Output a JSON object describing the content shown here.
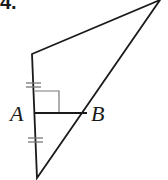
{
  "problem": {
    "number": "4."
  },
  "diagram": {
    "type": "triangle-with-perpendicular-segment",
    "stroke_color": "#1a1a1a",
    "aux_color": "#777777",
    "vertices": {
      "top_right": [
        160,
        0
      ],
      "top_left": [
        32,
        54
      ],
      "bottom": [
        37,
        178
      ]
    },
    "points": [
      {
        "label": "A",
        "at": [
          35,
          113
        ],
        "label_pos": [
          10,
          121
        ]
      },
      {
        "label": "B",
        "at": [
          87,
          112
        ],
        "label_pos": [
          91,
          121
        ]
      }
    ],
    "right_angle_marker": {
      "x": 35,
      "y": 91,
      "w": 24,
      "h": 22
    },
    "congruence_marks": [
      {
        "segment": "upper-left-side",
        "count": 2,
        "center": [
          34,
          85
        ]
      },
      {
        "segment": "lower-left-side",
        "count": 2,
        "center": [
          36,
          140
        ]
      }
    ]
  }
}
